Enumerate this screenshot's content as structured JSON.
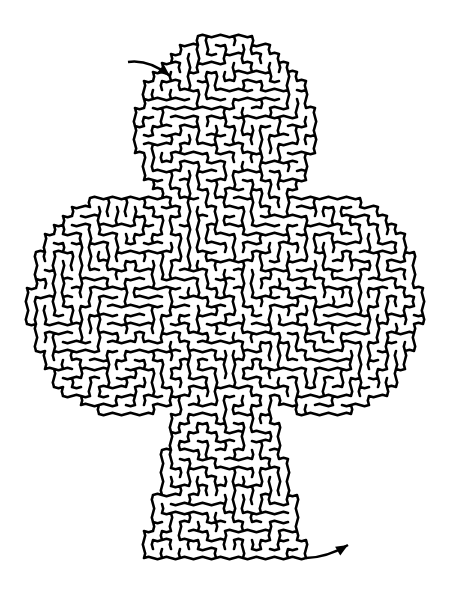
{
  "puzzle": {
    "type": "maze",
    "shape": "club",
    "cell_style": "hexagonal",
    "background_color": "#ffffff",
    "line_color": "#000000",
    "line_width": 2.6,
    "cell_size": 9,
    "seed": 17
  },
  "outline": {
    "top_lobe": {
      "cx": 225,
      "cy": 130,
      "rx": 88,
      "ry": 95
    },
    "left_lobe": {
      "cx": 125,
      "cy": 305,
      "rx": 95,
      "ry": 110
    },
    "right_lobe": {
      "cx": 325,
      "cy": 305,
      "rx": 95,
      "ry": 110
    },
    "center": {
      "x": 150,
      "y": 200,
      "w": 150,
      "h": 200
    },
    "stem": {
      "top_y": 400,
      "bottom_y": 560,
      "top_left": 178,
      "top_right": 270,
      "bottom_left": 143,
      "bottom_right": 307
    }
  },
  "start_arrow": {
    "label": "start",
    "from": [
      128,
      62
    ],
    "to": [
      170,
      76
    ]
  },
  "end_arrow": {
    "label": "finish",
    "from": [
      306,
      558
    ],
    "to": [
      348,
      545
    ]
  }
}
